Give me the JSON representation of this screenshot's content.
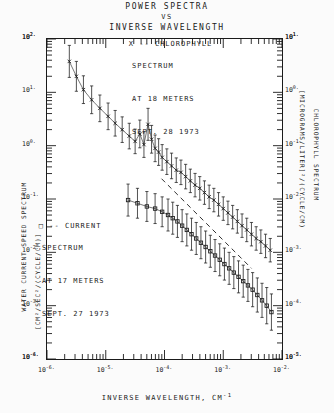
{
  "title": {
    "line1": "POWER SPECTRA",
    "line2": "VS",
    "line3": "INVERSE WAVELENGTH"
  },
  "axes": {
    "x": {
      "label": "INVERSE WAVELENGTH, CM",
      "label_exp": "-1",
      "base": "10",
      "tick_exponents": [
        "-6.",
        "-5.",
        "-4.",
        "-3.",
        "-2."
      ],
      "range": [
        -6,
        -2
      ]
    },
    "y_left": {
      "title_line1": "WATER CURRENT SPEED SPECTRUM",
      "title_line2": "[CM²/SEC²/(CYCLE/CM)]",
      "base": "10",
      "tick_exponents": [
        "2.",
        "1.",
        "0.",
        "-1.",
        "-2.",
        "-3.",
        "-4."
      ],
      "range": [
        -4,
        2
      ]
    },
    "y_right": {
      "title_line1": "CHLOROPHYLL SPECTRUM",
      "title_line2": "[MICROGRAMS/LITER]²/(CYCLE/CM)",
      "base": "10",
      "tick_exponents": [
        "1.",
        "0.",
        "-1.",
        "-2.",
        "-3.",
        "-4.",
        "-5."
      ],
      "range": [
        -5,
        1
      ]
    }
  },
  "annotations": {
    "chlorophyll": {
      "marker": "X",
      "line1": "X -- CHLOROPHYLL",
      "line2": "SPECTRUM",
      "line3": "AT 18 METERS",
      "line4": "SEPT. 28 1973"
    },
    "current": {
      "marker": "□",
      "line1": "□ -- CURRENT",
      "line2": "SPECTRUM",
      "line3": "AT 17 METERS",
      "line4": "SEPT. 27 1973"
    }
  },
  "colors": {
    "ink": "#1a1a1a",
    "paper": "#fbfbfb",
    "plot_bg": "#ffffff"
  },
  "chart_data": {
    "type": "scatter",
    "title": "POWER SPECTRA VS INVERSE WAVELENGTH",
    "xlabel": "INVERSE WAVELENGTH, CM^-1",
    "ylabel": "WATER CURRENT SPEED SPECTRUM [CM^2/SEC^2/(CYCLE/CM)]",
    "ylabel_right": "CHLOROPHYLL SPECTRUM [MICROGRAMS/LITER]^2/(CYCLE/CM)",
    "xscale": "log",
    "yscale": "log",
    "grid": false,
    "xlim": [
      -6,
      -2
    ],
    "ylim": [
      -4,
      2
    ],
    "legend": [
      "X -- CHLOROPHYLL SPECTRUM AT 18 METERS SEPT. 28 1973",
      "□ -- CURRENT SPECTRUM AT 17 METERS SEPT. 27 1973"
    ],
    "series": [
      {
        "name": "CHLOROPHYLL SPECTRUM AT 18 METERS SEPT. 28 1973",
        "marker": "x",
        "errorbars": true,
        "points": [
          {
            "x": -5.62,
            "y": 1.58,
            "e": 0.3
          },
          {
            "x": -5.5,
            "y": 1.3,
            "e": 0.28
          },
          {
            "x": -5.38,
            "y": 1.05,
            "e": 0.26
          },
          {
            "x": -5.24,
            "y": 0.86,
            "e": 0.26
          },
          {
            "x": -5.1,
            "y": 0.7,
            "e": 0.25
          },
          {
            "x": -4.96,
            "y": 0.55,
            "e": 0.25
          },
          {
            "x": -4.84,
            "y": 0.42,
            "e": 0.24
          },
          {
            "x": -4.72,
            "y": 0.3,
            "e": 0.24
          },
          {
            "x": -4.6,
            "y": 0.18,
            "e": 0.24
          },
          {
            "x": -4.5,
            "y": 0.08,
            "e": 0.23
          },
          {
            "x": -4.42,
            "y": 0.22,
            "e": 0.26
          },
          {
            "x": -4.35,
            "y": 0.02,
            "e": 0.24
          },
          {
            "x": -4.28,
            "y": 0.4,
            "e": 0.3
          },
          {
            "x": -4.22,
            "y": 0.12,
            "e": 0.26
          },
          {
            "x": -4.16,
            "y": -0.05,
            "e": 0.25
          },
          {
            "x": -4.1,
            "y": -0.12,
            "e": 0.25
          },
          {
            "x": -4.04,
            "y": -0.22,
            "e": 0.24
          },
          {
            "x": -3.96,
            "y": -0.3,
            "e": 0.24
          },
          {
            "x": -3.88,
            "y": -0.38,
            "e": 0.24
          },
          {
            "x": -3.8,
            "y": -0.46,
            "e": 0.23
          },
          {
            "x": -3.72,
            "y": -0.5,
            "e": 0.23
          },
          {
            "x": -3.64,
            "y": -0.58,
            "e": 0.23
          },
          {
            "x": -3.56,
            "y": -0.66,
            "e": 0.22
          },
          {
            "x": -3.48,
            "y": -0.74,
            "e": 0.22
          },
          {
            "x": -3.4,
            "y": -0.8,
            "e": 0.22
          },
          {
            "x": -3.32,
            "y": -0.88,
            "e": 0.22
          },
          {
            "x": -3.24,
            "y": -0.96,
            "e": 0.22
          },
          {
            "x": -3.16,
            "y": -1.02,
            "e": 0.22
          },
          {
            "x": -3.08,
            "y": -1.1,
            "e": 0.22
          },
          {
            "x": -3.0,
            "y": -1.18,
            "e": 0.22
          },
          {
            "x": -2.92,
            "y": -1.26,
            "e": 0.22
          },
          {
            "x": -2.84,
            "y": -1.34,
            "e": 0.22
          },
          {
            "x": -2.76,
            "y": -1.42,
            "e": 0.22
          },
          {
            "x": -2.68,
            "y": -1.5,
            "e": 0.22
          },
          {
            "x": -2.6,
            "y": -1.58,
            "e": 0.22
          },
          {
            "x": -2.52,
            "y": -1.66,
            "e": 0.22
          },
          {
            "x": -2.44,
            "y": -1.74,
            "e": 0.22
          },
          {
            "x": -2.36,
            "y": -1.8,
            "e": 0.22
          },
          {
            "x": -2.28,
            "y": -1.88,
            "e": 0.22
          },
          {
            "x": -2.2,
            "y": -1.96,
            "e": 0.22
          }
        ]
      },
      {
        "name": "CURRENT SPECTRUM AT 17 METERS SEPT. 27 1973",
        "marker": "square",
        "errorbars": true,
        "points": [
          {
            "x": -4.62,
            "y": -1.02,
            "e": 0.3
          },
          {
            "x": -4.46,
            "y": -1.08,
            "e": 0.28
          },
          {
            "x": -4.3,
            "y": -1.14,
            "e": 0.28
          },
          {
            "x": -4.16,
            "y": -1.18,
            "e": 0.28
          },
          {
            "x": -4.04,
            "y": -1.24,
            "e": 0.28
          },
          {
            "x": -3.94,
            "y": -1.3,
            "e": 0.3
          },
          {
            "x": -3.86,
            "y": -1.36,
            "e": 0.3
          },
          {
            "x": -3.78,
            "y": -1.42,
            "e": 0.3
          },
          {
            "x": -3.7,
            "y": -1.5,
            "e": 0.3
          },
          {
            "x": -3.62,
            "y": -1.58,
            "e": 0.3
          },
          {
            "x": -3.54,
            "y": -1.66,
            "e": 0.3
          },
          {
            "x": -3.46,
            "y": -1.74,
            "e": 0.3
          },
          {
            "x": -3.38,
            "y": -1.82,
            "e": 0.3
          },
          {
            "x": -3.3,
            "y": -1.9,
            "e": 0.3
          },
          {
            "x": -3.22,
            "y": -1.98,
            "e": 0.3
          },
          {
            "x": -3.14,
            "y": -2.06,
            "e": 0.3
          },
          {
            "x": -3.06,
            "y": -2.14,
            "e": 0.3
          },
          {
            "x": -2.98,
            "y": -2.22,
            "e": 0.3
          },
          {
            "x": -2.9,
            "y": -2.3,
            "e": 0.3
          },
          {
            "x": -2.82,
            "y": -2.38,
            "e": 0.3
          },
          {
            "x": -2.74,
            "y": -2.46,
            "e": 0.3
          },
          {
            "x": -2.66,
            "y": -2.54,
            "e": 0.3
          },
          {
            "x": -2.58,
            "y": -2.62,
            "e": 0.3
          },
          {
            "x": -2.5,
            "y": -2.7,
            "e": 0.32
          },
          {
            "x": -2.42,
            "y": -2.8,
            "e": 0.32
          },
          {
            "x": -2.34,
            "y": -2.9,
            "e": 0.32
          },
          {
            "x": -2.26,
            "y": -3.0,
            "e": 0.34
          },
          {
            "x": -2.18,
            "y": -3.12,
            "e": 0.34
          }
        ]
      }
    ],
    "reference_line": {
      "style": "dashed",
      "note": "slope reference",
      "from": {
        "x": -4.05,
        "y": -0.62
      },
      "to": {
        "x": -2.52,
        "y": -2.3
      }
    }
  }
}
